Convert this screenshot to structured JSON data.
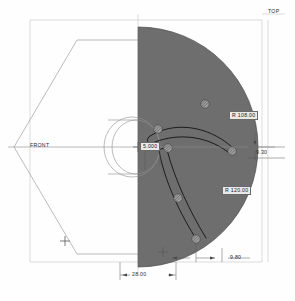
{
  "drawing": {
    "title": "Impeller half-section technical drawing",
    "view_labels": {
      "top": "TOP",
      "front": "FRONT"
    },
    "dimensions": [
      {
        "id": "radius-outer",
        "text": "R 108.00",
        "boxed": true
      },
      {
        "id": "radius-inner",
        "text": "R 120.00",
        "boxed": true
      },
      {
        "id": "hub-diameter",
        "text": "5.000",
        "boxed": true
      },
      {
        "id": "edge-thickness",
        "text": "9.30",
        "boxed": false
      },
      {
        "id": "blade-offset",
        "text": "9.80",
        "boxed": false
      },
      {
        "id": "hub-width",
        "text": "28.00",
        "boxed": false
      }
    ],
    "colors": {
      "disc_fill": "#6e6e6e",
      "outline": "#3a3a3a",
      "thin_line": "#9a9a9a",
      "dim_box_bg": "#e9e9e9",
      "background": "#fefefe"
    },
    "markers": {
      "bolt_hole_count": 6,
      "crosshair_count": 2
    },
    "geometry": {
      "disc_center_x": 138,
      "disc_center_y": 147,
      "disc_radius": 120,
      "frame_left": 30,
      "frame_top": 20,
      "frame_right": 262,
      "frame_bottom": 262
    }
  }
}
